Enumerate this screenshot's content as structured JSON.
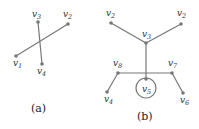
{
  "panels": [
    {
      "caption": "(a)",
      "nodes": [
        {
          "id": "v1",
          "label": "v",
          "sub": "1"
        },
        {
          "id": "v2",
          "label": "v",
          "sub": "2"
        },
        {
          "id": "v3",
          "label": "v",
          "sub": "3"
        },
        {
          "id": "v4",
          "label": "v",
          "sub": "4"
        }
      ],
      "edges": [
        [
          "v1",
          "v2"
        ],
        [
          "v3",
          "v4"
        ]
      ]
    },
    {
      "caption": "(b)",
      "nodes": [
        {
          "id": "v1",
          "label": "v",
          "sub": "1"
        },
        {
          "id": "v2",
          "label": "v",
          "sub": "2"
        },
        {
          "id": "v3",
          "label": "v",
          "sub": "3"
        },
        {
          "id": "v4",
          "label": "v",
          "sub": "4"
        },
        {
          "id": "v5",
          "label": "v",
          "sub": "5"
        },
        {
          "id": "v6",
          "label": "v",
          "sub": "6"
        },
        {
          "id": "v7",
          "label": "v",
          "sub": "7"
        },
        {
          "id": "v8",
          "label": "v",
          "sub": "8"
        }
      ],
      "edges": [
        [
          "v1",
          "v3"
        ],
        [
          "v2",
          "v3"
        ],
        [
          "v3",
          "junction"
        ],
        [
          "v8",
          "v7"
        ],
        [
          "v8",
          "v4"
        ],
        [
          "v7",
          "v6"
        ],
        [
          "junction",
          "v5"
        ]
      ],
      "highlight": "v5 (circled)"
    }
  ],
  "colors": {
    "edge": "#777777",
    "node": "#777777",
    "text": "#333333"
  }
}
